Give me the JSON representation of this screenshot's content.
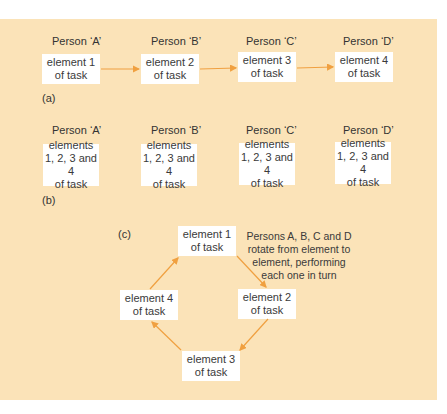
{
  "colors": {
    "background": "#fbe3b8",
    "box": "#ffffff",
    "arrow": "#f0a040",
    "text": "#3a3a3a"
  },
  "panel_a": {
    "label": "(a)",
    "persons": [
      "Person ‘A’",
      "Person ‘B’",
      "Person ‘C’",
      "Person ‘D’"
    ],
    "boxes": [
      {
        "line1": "element 1",
        "line2": "of task"
      },
      {
        "line1": "element 2",
        "line2": "of task"
      },
      {
        "line1": "element 3",
        "line2": "of task"
      },
      {
        "line1": "element 4",
        "line2": "of task"
      }
    ]
  },
  "panel_b": {
    "label": "(b)",
    "persons": [
      "Person ‘A’",
      "Person ‘B’",
      "Person ‘C’",
      "Person ‘D’"
    ],
    "boxes": [
      {
        "line1": "elements",
        "line2": "1, 2, 3 and 4",
        "line3": "of task"
      },
      {
        "line1": "elements",
        "line2": "1, 2, 3 and 4",
        "line3": "of task"
      },
      {
        "line1": "elements",
        "line2": "1, 2, 3 and 4",
        "line3": "of task"
      },
      {
        "line1": "elements",
        "line2": "1, 2, 3 and 4",
        "line3": "of task"
      }
    ]
  },
  "panel_c": {
    "label": "(c)",
    "boxes": [
      {
        "line1": "element 1",
        "line2": "of task"
      },
      {
        "line1": "element 2",
        "line2": "of task"
      },
      {
        "line1": "element 3",
        "line2": "of task"
      },
      {
        "line1": "element 4",
        "line2": "of task"
      }
    ],
    "note": [
      "Persons A, B, C and D",
      "rotate from element to",
      "element, performing",
      "each one in turn"
    ]
  }
}
